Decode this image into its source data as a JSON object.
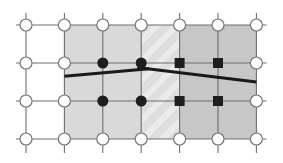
{
  "diagram": {
    "columns": 7,
    "rows": 4,
    "colors": {
      "background": "#ffffff",
      "grid_line": "#6e6e6e",
      "region_left": "#d9d9d9",
      "region_band": "#dedede",
      "region_band_stripe": "#ebebeb",
      "region_right": "#c7c7c7",
      "node_open_fill": "#ffffff",
      "node_open_stroke": "#777777",
      "node_filled": "#1e1e1e",
      "interface_line": "#1a1a1a"
    },
    "regions": [
      {
        "name": "left-subdomain",
        "col_start": 1,
        "col_end": 3,
        "row_start": 0,
        "row_end": 3,
        "color_key": "region_left"
      },
      {
        "name": "overlap-band",
        "col_start": 3,
        "col_end": 4,
        "row_start": 0,
        "row_end": 3,
        "color_key": "region_band",
        "pattern": "diagonal-stripes"
      },
      {
        "name": "right-subdomain",
        "col_start": 4,
        "col_end": 6,
        "row_start": 0,
        "row_end": 3,
        "color_key": "region_right"
      }
    ],
    "nodes": [
      {
        "col": 0,
        "row": 0,
        "kind": "open-circle"
      },
      {
        "col": 1,
        "row": 0,
        "kind": "open-circle"
      },
      {
        "col": 2,
        "row": 0,
        "kind": "open-circle"
      },
      {
        "col": 3,
        "row": 0,
        "kind": "open-circle"
      },
      {
        "col": 4,
        "row": 0,
        "kind": "open-circle"
      },
      {
        "col": 5,
        "row": 0,
        "kind": "open-circle"
      },
      {
        "col": 6,
        "row": 0,
        "kind": "open-circle"
      },
      {
        "col": 0,
        "row": 1,
        "kind": "open-circle"
      },
      {
        "col": 1,
        "row": 1,
        "kind": "open-circle"
      },
      {
        "col": 2,
        "row": 1,
        "kind": "filled-circle"
      },
      {
        "col": 3,
        "row": 1,
        "kind": "filled-circle"
      },
      {
        "col": 4,
        "row": 1,
        "kind": "filled-square"
      },
      {
        "col": 5,
        "row": 1,
        "kind": "filled-square"
      },
      {
        "col": 6,
        "row": 1,
        "kind": "open-circle"
      },
      {
        "col": 0,
        "row": 2,
        "kind": "open-circle"
      },
      {
        "col": 1,
        "row": 2,
        "kind": "open-circle"
      },
      {
        "col": 2,
        "row": 2,
        "kind": "filled-circle"
      },
      {
        "col": 3,
        "row": 2,
        "kind": "filled-circle"
      },
      {
        "col": 4,
        "row": 2,
        "kind": "filled-square"
      },
      {
        "col": 5,
        "row": 2,
        "kind": "filled-square"
      },
      {
        "col": 6,
        "row": 2,
        "kind": "open-circle"
      },
      {
        "col": 0,
        "row": 3,
        "kind": "open-circle"
      },
      {
        "col": 1,
        "row": 3,
        "kind": "open-circle"
      },
      {
        "col": 2,
        "row": 3,
        "kind": "open-circle"
      },
      {
        "col": 3,
        "row": 3,
        "kind": "open-circle"
      },
      {
        "col": 4,
        "row": 3,
        "kind": "open-circle"
      },
      {
        "col": 5,
        "row": 3,
        "kind": "open-circle"
      },
      {
        "col": 6,
        "row": 3,
        "kind": "open-circle"
      }
    ],
    "interface_segments": [
      {
        "name": "interface-left-segment",
        "from": {
          "col": 1,
          "row": 1.35
        },
        "to": {
          "col": 3.2,
          "row": 1.15
        }
      },
      {
        "name": "interface-right-segment",
        "from": {
          "col": 2.9,
          "row": 1.12
        },
        "to": {
          "col": 6,
          "row": 1.5
        }
      }
    ]
  }
}
